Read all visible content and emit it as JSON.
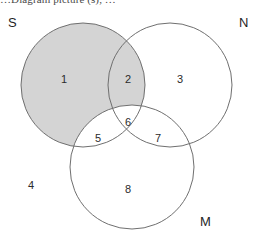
{
  "caption": {
    "text": "…Diagram picture (s), …"
  },
  "colors": {
    "background": "#ffffff",
    "stroke": "#6f6f6f",
    "shade_fill": "#d4d4d4",
    "unshaded_fill": "#ffffff",
    "label_text": "#2b2b2b"
  },
  "diagram": {
    "type": "venn-3-set",
    "shaded_description": "S minus M",
    "sets": [
      {
        "id": "S",
        "label": "S",
        "label_x": 8,
        "label_y": 16,
        "cx": 83,
        "cy": 85,
        "r": 62,
        "shaded": true
      },
      {
        "id": "N",
        "label": "N",
        "label_x": 239,
        "label_y": 16,
        "cx": 170,
        "cy": 85,
        "r": 62,
        "shaded": false
      },
      {
        "id": "M",
        "label": "M",
        "label_x": 200,
        "label_y": 215,
        "cx": 132,
        "cy": 167,
        "r": 62,
        "shaded": false
      }
    ],
    "regions": [
      {
        "id": "1",
        "label": "1",
        "belongs_to": "S only",
        "x": 64,
        "y": 74,
        "shaded": true
      },
      {
        "id": "2",
        "label": "2",
        "belongs_to": "S and N",
        "x": 128,
        "y": 74,
        "shaded": true
      },
      {
        "id": "3",
        "label": "3",
        "belongs_to": "N only",
        "x": 180,
        "y": 74,
        "shaded": false
      },
      {
        "id": "5",
        "label": "5",
        "belongs_to": "S and M",
        "x": 98,
        "y": 133,
        "shaded": false
      },
      {
        "id": "6",
        "label": "6",
        "belongs_to": "S and N and M",
        "x": 128,
        "y": 117,
        "shaded": false
      },
      {
        "id": "7",
        "label": "7",
        "belongs_to": "N and M",
        "x": 158,
        "y": 133,
        "shaded": false
      },
      {
        "id": "8",
        "label": "8",
        "belongs_to": "M only",
        "x": 128,
        "y": 184,
        "shaded": false
      },
      {
        "id": "4",
        "label": "4",
        "belongs_to": "universe outside all sets",
        "x": 31,
        "y": 180,
        "shaded": false
      }
    ]
  }
}
